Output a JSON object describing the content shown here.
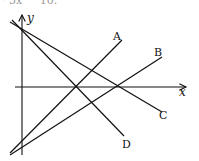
{
  "header_fragment": "· 5x     10.",
  "axes": {
    "x_label": "x",
    "y_label": "y"
  },
  "lines": [
    {
      "label": "A",
      "from": [
        10,
        153
      ],
      "to": [
        122,
        40
      ]
    },
    {
      "label": "B",
      "from": [
        10,
        155
      ],
      "to": [
        162,
        57
      ]
    },
    {
      "label": "C",
      "from": [
        10,
        22
      ],
      "to": [
        162,
        112
      ]
    },
    {
      "label": "D",
      "from": [
        12,
        20
      ],
      "to": [
        124,
        136
      ]
    }
  ],
  "colors": {
    "ink": "#111111",
    "background": "#ffffff"
  }
}
